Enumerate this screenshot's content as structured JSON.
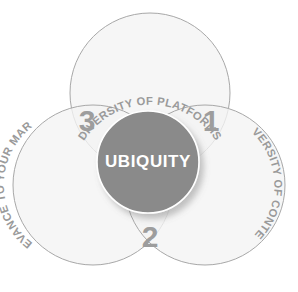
{
  "diagram": {
    "title_text": "UBIQUITY",
    "type": "venn-three-circle",
    "background_color": "#ffffff",
    "circle_fill_color": "#f4f4f4",
    "circle_stroke_color": "#a8a8a8",
    "center_disc_color": "#8a8a8a",
    "center_text_color": "#ffffff",
    "label_text_color": "#9a9a9a",
    "number_text_color": "#9d9d9d"
  },
  "circles": [
    {
      "id": "platforms",
      "label": "DIVERSITY OF PLATFORMS",
      "position": "top",
      "center_x": 150,
      "center_y": 93,
      "radius": 80
    },
    {
      "id": "market",
      "label": "RELEVANCE TO YOUR MARKET",
      "position": "left",
      "center_x": 93,
      "center_y": 185,
      "radius": 80
    },
    {
      "id": "content",
      "label": "DIVERSITY OF CONTENT",
      "position": "right",
      "center_x": 205,
      "center_y": 185,
      "radius": 80
    }
  ],
  "center": {
    "label": "UBIQUITY",
    "center_x": 148,
    "center_y": 162,
    "radius": 51
  },
  "lobes": [
    {
      "id": "lobe-1",
      "number": "1",
      "x": 211,
      "y": 122
    },
    {
      "id": "lobe-2",
      "number": "2",
      "x": 150,
      "y": 238
    },
    {
      "id": "lobe-3",
      "number": "3",
      "x": 87,
      "y": 122
    }
  ]
}
